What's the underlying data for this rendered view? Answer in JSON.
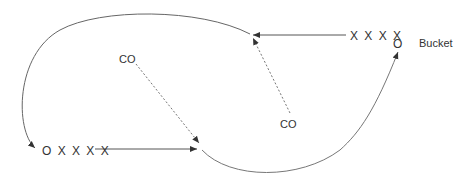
{
  "labels": {
    "top_queue": "X X X X",
    "bucket_o": "O",
    "bucket": "Bucket",
    "co_left": "CO",
    "co_right": "CO",
    "bottom_queue": "O X X X X"
  },
  "colors": {
    "line": "#555555",
    "text": "#333333",
    "dotted": "#777777"
  }
}
